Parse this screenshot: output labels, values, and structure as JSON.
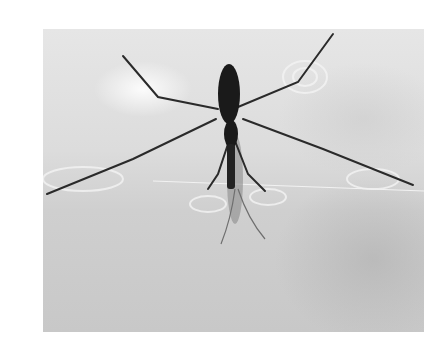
{
  "image": {
    "subject": "water strider on water surface",
    "style": "grayscale photograph",
    "colors": {
      "background": "#ffffff",
      "water_light": "#e6e6e6",
      "water_dark": "#c8c8c8",
      "insect": "#1a1a1a"
    }
  }
}
